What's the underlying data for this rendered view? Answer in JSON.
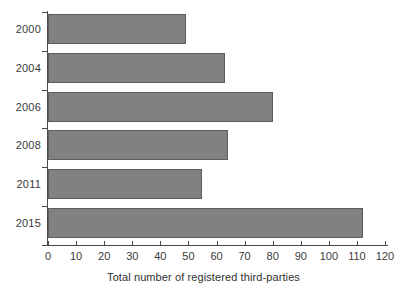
{
  "chart_data": {
    "type": "bar",
    "orientation": "horizontal",
    "title": "",
    "xlabel": "Total number of registered third-parties",
    "ylabel": "",
    "categories": [
      "2000",
      "2004",
      "2006",
      "2008",
      "2011",
      "2015"
    ],
    "values": [
      49,
      63,
      80,
      64,
      55,
      112
    ],
    "series": [
      {
        "name": "Total number of registered third-parties",
        "values": [
          49,
          63,
          80,
          64,
          55,
          112
        ]
      }
    ],
    "xlim": [
      0,
      120
    ],
    "xticks": [
      0,
      10,
      20,
      30,
      40,
      50,
      60,
      70,
      80,
      90,
      100,
      110,
      120
    ],
    "xtick_labels": [
      "0",
      "10",
      "20",
      "30",
      "40",
      "50",
      "60",
      "70",
      "80",
      "90",
      "100",
      "110",
      "120"
    ],
    "grid": false,
    "legend": null,
    "legend_position": "none",
    "bar_color": "#818181",
    "bar_border_color": "#5d5d5d",
    "axis_color": "#4a4a4a",
    "background_color": "#ffffff"
  }
}
